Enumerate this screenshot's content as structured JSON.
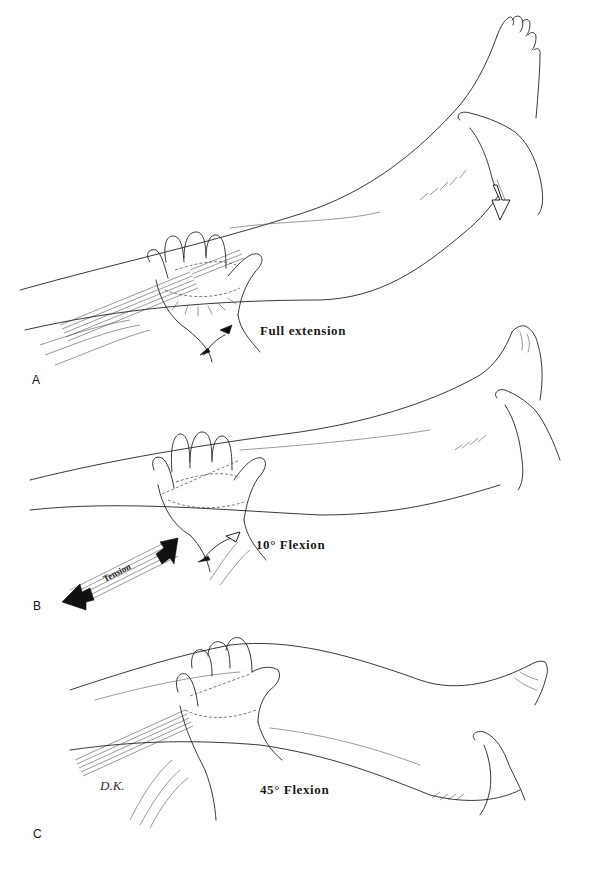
{
  "figure": {
    "panels": [
      {
        "letter": "A",
        "caption": "Full extension",
        "hand_position": "palm on anterior thigh above knee",
        "foot_support": "examiner hand under heel",
        "force_arrows": [
          "upward arrow at wrist",
          "downward open arrow at heel"
        ]
      },
      {
        "letter": "B",
        "caption": "10° Flexion",
        "tension_label": "Tension",
        "hand_position": "palm on anterior thigh above knee",
        "foot_support": "examiner hand under heel",
        "force_arrows": [
          "upward open arrow at wrist",
          "double-headed tension arrow along thigh"
        ]
      },
      {
        "letter": "C",
        "caption": "45° Flexion",
        "hand_position": "palm on anterior thigh above knee",
        "foot_support": "examiner hand under heel",
        "signature": "D.K."
      }
    ],
    "colors": {
      "background": "#ffffff",
      "ink": "#222222",
      "label": "#111111"
    }
  }
}
